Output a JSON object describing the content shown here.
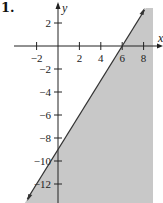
{
  "problem_number": "1.",
  "chart_data": {
    "type": "area",
    "title": "",
    "boundary_line": {
      "slope": 1.5,
      "intercept": -9,
      "style": "solid",
      "points": [
        [
          6,
          0
        ],
        [
          0,
          -9
        ]
      ]
    },
    "inequality": "y <= 1.5x - 9",
    "shaded_region": "below-right",
    "xlabel": "x",
    "ylabel": "y",
    "x_ticks": [
      -2,
      2,
      4,
      6,
      8
    ],
    "y_ticks": [
      2,
      -2,
      -4,
      -6,
      -8,
      -10,
      -12
    ],
    "xlim": [
      -4,
      9.5
    ],
    "ylim": [
      -13.5,
      3.5
    ],
    "grid": false,
    "colors": {
      "shade": "#c8c8c8",
      "line": "#333333",
      "axis": "#222222"
    }
  }
}
